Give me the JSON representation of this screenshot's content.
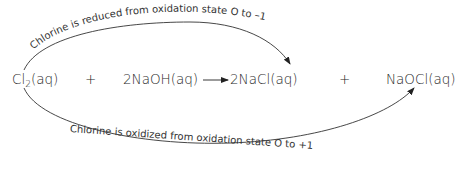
{
  "equation": {
    "reactant1": "Cl",
    "reactant1_sub": "2",
    "reactant1_state": "(aq)",
    "plus1": "+",
    "reactant2": "2NaOH(aq)",
    "product1": "2NaCl(aq)",
    "plus2": "+",
    "product2": "NaOCl(aq)"
  },
  "annotations": {
    "reduction": "Chlorine is reduced from oxidation state O to –1",
    "oxidation": "Chlorine is oxidized from oxidation state O to +1"
  }
}
